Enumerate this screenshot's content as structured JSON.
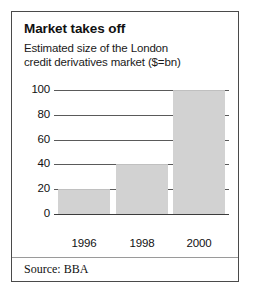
{
  "figure": {
    "title": "Market takes off",
    "subtitle_line1": "Estimated size of the London",
    "subtitle_line2": "credit derivatives market ($=bn)",
    "source": "Source: BBA",
    "border_color": "#4a4a4a",
    "bar_color": "#d2d2d2",
    "gridline_color": "#5a5a5a"
  },
  "chart_data": {
    "type": "bar",
    "title": "Market takes off",
    "subtitle": "Estimated size of the London credit derivatives market ($=bn)",
    "categories": [
      "1996",
      "1998",
      "2000"
    ],
    "values": [
      20,
      40,
      100
    ],
    "xlabel": "",
    "ylabel": "",
    "ylim": [
      0,
      100
    ],
    "yticks": [
      0,
      20,
      40,
      60,
      80,
      100
    ],
    "ytick_labels": [
      "0",
      "20",
      "40",
      "60",
      "80",
      "100"
    ],
    "grid": true,
    "legend": false,
    "units": "$=bn",
    "source": "Source: BBA"
  }
}
